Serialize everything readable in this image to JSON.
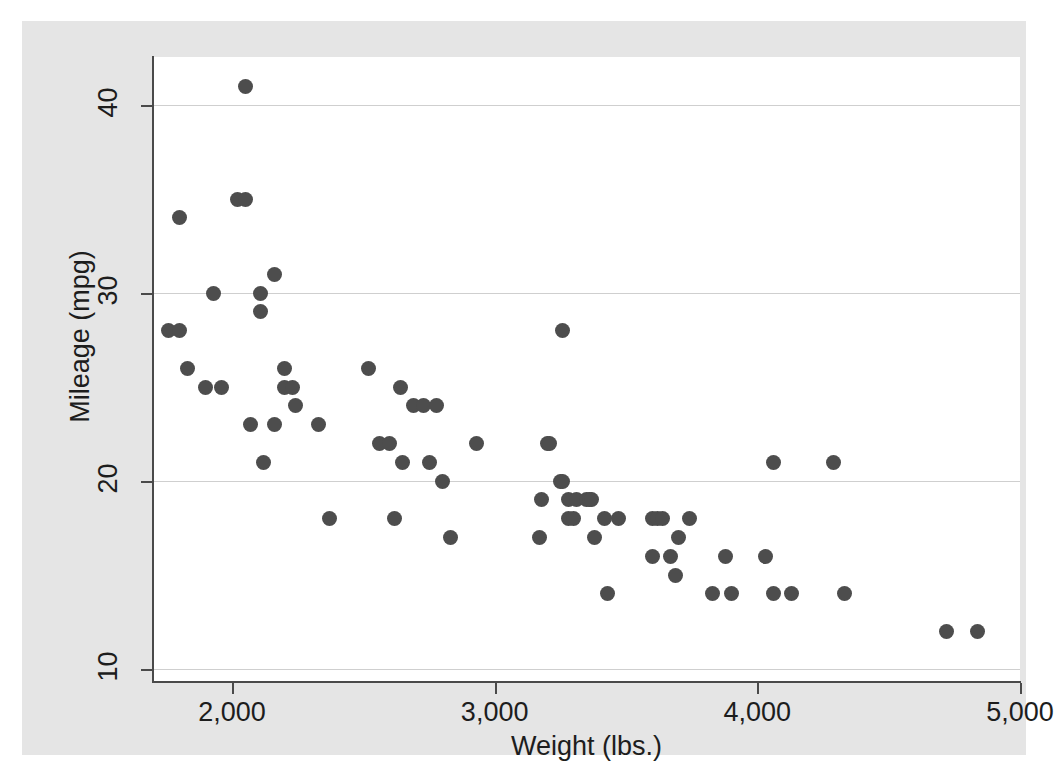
{
  "chart_data": {
    "type": "scatter",
    "title": "",
    "xlabel": "Weight (lbs.)",
    "ylabel": "Mileage (mpg)",
    "xlim": [
      1650,
      5000
    ],
    "ylim": [
      10,
      42
    ],
    "xticks": [
      2000,
      3000,
      4000,
      5000
    ],
    "xtick_labels": [
      "2,000",
      "3,000",
      "4,000",
      "5,000"
    ],
    "yticks": [
      10,
      20,
      30,
      40
    ],
    "ytick_labels": [
      "10",
      "20",
      "30",
      "40"
    ],
    "grid": "horizontal",
    "legend": "none",
    "marker_color": "#4d4d4d",
    "marker_size": 15,
    "n_points": 74,
    "points": [
      {
        "x": 1760,
        "y": 28
      },
      {
        "x": 1800,
        "y": 28
      },
      {
        "x": 1800,
        "y": 34
      },
      {
        "x": 1830,
        "y": 26
      },
      {
        "x": 1900,
        "y": 25
      },
      {
        "x": 1930,
        "y": 30
      },
      {
        "x": 1960,
        "y": 25
      },
      {
        "x": 2020,
        "y": 35
      },
      {
        "x": 2050,
        "y": 41
      },
      {
        "x": 2050,
        "y": 35
      },
      {
        "x": 2070,
        "y": 23
      },
      {
        "x": 2110,
        "y": 30
      },
      {
        "x": 2110,
        "y": 29
      },
      {
        "x": 2120,
        "y": 21
      },
      {
        "x": 2160,
        "y": 23
      },
      {
        "x": 2160,
        "y": 31
      },
      {
        "x": 2200,
        "y": 26
      },
      {
        "x": 2200,
        "y": 25
      },
      {
        "x": 2230,
        "y": 25
      },
      {
        "x": 2240,
        "y": 24
      },
      {
        "x": 2330,
        "y": 23
      },
      {
        "x": 2370,
        "y": 18
      },
      {
        "x": 2520,
        "y": 26
      },
      {
        "x": 2560,
        "y": 22
      },
      {
        "x": 2600,
        "y": 22
      },
      {
        "x": 2620,
        "y": 18
      },
      {
        "x": 2640,
        "y": 25
      },
      {
        "x": 2650,
        "y": 21
      },
      {
        "x": 2690,
        "y": 24
      },
      {
        "x": 2730,
        "y": 24
      },
      {
        "x": 2750,
        "y": 21
      },
      {
        "x": 2780,
        "y": 24
      },
      {
        "x": 2800,
        "y": 20
      },
      {
        "x": 2830,
        "y": 17
      },
      {
        "x": 2930,
        "y": 22
      },
      {
        "x": 3170,
        "y": 17
      },
      {
        "x": 3180,
        "y": 19
      },
      {
        "x": 3200,
        "y": 22
      },
      {
        "x": 3210,
        "y": 22
      },
      {
        "x": 3250,
        "y": 20
      },
      {
        "x": 3260,
        "y": 28
      },
      {
        "x": 3260,
        "y": 20
      },
      {
        "x": 3280,
        "y": 19
      },
      {
        "x": 3280,
        "y": 18
      },
      {
        "x": 3300,
        "y": 18
      },
      {
        "x": 3310,
        "y": 19
      },
      {
        "x": 3350,
        "y": 19
      },
      {
        "x": 3360,
        "y": 19
      },
      {
        "x": 3370,
        "y": 19
      },
      {
        "x": 3380,
        "y": 17
      },
      {
        "x": 3420,
        "y": 18
      },
      {
        "x": 3430,
        "y": 14
      },
      {
        "x": 3470,
        "y": 18
      },
      {
        "x": 3600,
        "y": 18
      },
      {
        "x": 3600,
        "y": 16
      },
      {
        "x": 3620,
        "y": 18
      },
      {
        "x": 3640,
        "y": 18
      },
      {
        "x": 3670,
        "y": 16
      },
      {
        "x": 3690,
        "y": 15
      },
      {
        "x": 3700,
        "y": 17
      },
      {
        "x": 3740,
        "y": 18
      },
      {
        "x": 3830,
        "y": 14
      },
      {
        "x": 3880,
        "y": 16
      },
      {
        "x": 3900,
        "y": 14
      },
      {
        "x": 4030,
        "y": 16
      },
      {
        "x": 4060,
        "y": 21
      },
      {
        "x": 4060,
        "y": 14
      },
      {
        "x": 4130,
        "y": 14
      },
      {
        "x": 4290,
        "y": 21
      },
      {
        "x": 4330,
        "y": 14
      },
      {
        "x": 4720,
        "y": 12
      },
      {
        "x": 4840,
        "y": 12
      }
    ]
  }
}
